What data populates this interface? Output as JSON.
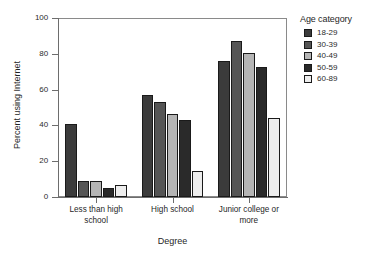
{
  "chart_data": {
    "type": "bar",
    "title": "",
    "xlabel": "Degree",
    "ylabel": "Percent using Internet",
    "categories": [
      "Less than high\nschool",
      "High school",
      "Junior college or\nmore"
    ],
    "ylim": [
      0,
      100
    ],
    "yticks": [
      0,
      20,
      40,
      60,
      80,
      100
    ],
    "ytick_labels": [
      "0",
      "20",
      "40",
      "60",
      "80",
      "100"
    ],
    "grid": false,
    "legend_position": "right",
    "legend_title": "Age category",
    "series": [
      {
        "name": "18-29",
        "color": "#3b3b3b",
        "values": [
          40.7,
          57.0,
          76.0
        ]
      },
      {
        "name": "30-39",
        "color": "#555555",
        "values": [
          9.0,
          53.3,
          87.0
        ]
      },
      {
        "name": "40-49",
        "color": "#b5b5b5",
        "values": [
          9.0,
          46.5,
          80.5
        ]
      },
      {
        "name": "50-59",
        "color": "#2a2a2a",
        "values": [
          5.0,
          43.0,
          72.5
        ]
      },
      {
        "name": "60-89",
        "color": "#ededed",
        "values": [
          6.5,
          14.5,
          44.0
        ]
      }
    ]
  }
}
